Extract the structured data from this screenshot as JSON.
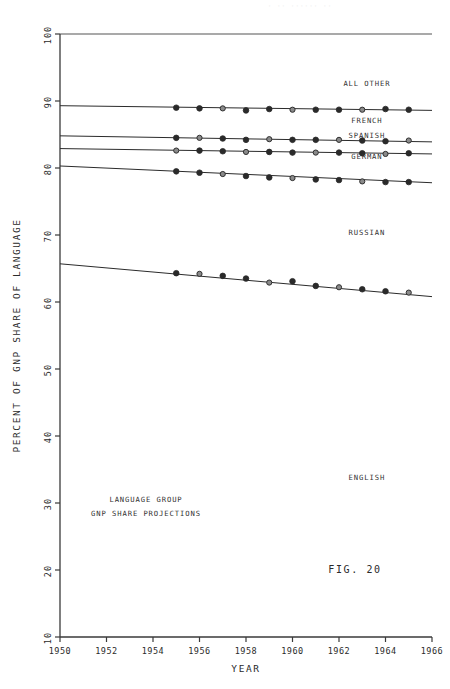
{
  "figure": {
    "caption": "FIG. 20",
    "note_line_1": "LANGUAGE GROUP",
    "note_line_2": "GNP SHARE PROJECTIONS"
  },
  "chart_data": {
    "type": "line",
    "title": "",
    "xlabel": "YEAR",
    "ylabel": "PERCENT OF GNP SHARE OF LANGUAGE",
    "xlim": [
      1950,
      1966
    ],
    "ylim": [
      10,
      100
    ],
    "xticks": [
      "1950",
      "1952",
      "1954",
      "1956",
      "1958",
      "1960",
      "1962",
      "1964",
      "1966"
    ],
    "xtick_values": [
      1950,
      1952,
      1954,
      1956,
      1958,
      1960,
      1962,
      1964,
      1966
    ],
    "yticks": [
      "10",
      "20",
      "30",
      "40",
      "50",
      "60",
      "70",
      "80",
      "90",
      "100"
    ],
    "ytick_values": [
      10,
      20,
      30,
      40,
      50,
      60,
      70,
      80,
      90,
      100
    ],
    "grid": false,
    "legend_position": "inline-right",
    "reference_line": {
      "label": "100 percent",
      "value": 100
    },
    "series": [
      {
        "name": "ALL OTHER",
        "label_x": 1963.2,
        "label_y": 92.2,
        "fit_start": [
          1950,
          89.3
        ],
        "fit_end": [
          1966,
          88.6
        ],
        "x": [
          1955,
          1956,
          1957,
          1958,
          1959,
          1960,
          1961,
          1962,
          1963,
          1964,
          1965
        ],
        "values": [
          89.0,
          88.9,
          88.9,
          88.6,
          88.8,
          88.7,
          88.7,
          88.7,
          88.7,
          88.8,
          88.7
        ]
      },
      {
        "name": "FRENCH",
        "label_x": 1963.2,
        "label_y": 86.7,
        "fit_start": [
          1950,
          84.8
        ],
        "fit_end": [
          1966,
          83.9
        ],
        "x": [
          1955,
          1956,
          1957,
          1958,
          1959,
          1960,
          1961,
          1962,
          1963,
          1964,
          1965
        ],
        "values": [
          84.5,
          84.5,
          84.4,
          84.2,
          84.3,
          84.2,
          84.2,
          84.2,
          84.1,
          84.0,
          84.1
        ]
      },
      {
        "name": "SPANISH",
        "label_x": 1963.2,
        "label_y": 84.5,
        "fit_start": [
          1950,
          82.9
        ],
        "fit_end": [
          1966,
          82.1
        ],
        "x": [
          1955,
          1956,
          1957,
          1958,
          1959,
          1960,
          1961,
          1962,
          1963,
          1964,
          1965
        ],
        "values": [
          82.6,
          82.6,
          82.5,
          82.4,
          82.4,
          82.3,
          82.3,
          82.3,
          82.2,
          82.1,
          82.2
        ]
      },
      {
        "name": "GERMAN",
        "label_x": 1963.2,
        "label_y": 81.3,
        "fit_start": [
          1950,
          80.3
        ],
        "fit_end": [
          1966,
          77.8
        ],
        "x": [
          1955,
          1956,
          1957,
          1958,
          1959,
          1960,
          1961,
          1962,
          1963,
          1964,
          1965
        ],
        "values": [
          79.5,
          79.3,
          79.1,
          78.8,
          78.6,
          78.5,
          78.3,
          78.2,
          78.0,
          77.9,
          77.9
        ]
      },
      {
        "name": "RUSSIAN",
        "label_x": 1963.2,
        "label_y": 70.0,
        "fit_start": [
          1950,
          65.7
        ],
        "fit_end": [
          1966,
          60.8
        ],
        "x": [
          1955,
          1956,
          1957,
          1958,
          1959,
          1960,
          1961,
          1962,
          1963,
          1964,
          1965
        ],
        "values": [
          64.3,
          64.2,
          63.9,
          63.5,
          62.9,
          63.1,
          62.4,
          62.2,
          61.9,
          61.6,
          61.4
        ]
      },
      {
        "name": "ENGLISH",
        "label_x": 1963.2,
        "label_y": 33.5,
        "fit_start": null,
        "fit_end": null,
        "x": [],
        "values": []
      }
    ]
  }
}
